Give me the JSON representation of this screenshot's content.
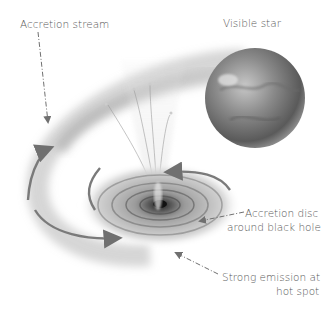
{
  "diagram": {
    "labels": {
      "accretion_stream": "Accretion stream",
      "visible_star": "Visible star",
      "disc_line1": "Accretion disc",
      "disc_line2": "around black hole",
      "hotspot_line1": "Strong emission at",
      "hotspot_line2": "hot spot"
    },
    "colors": {
      "background": "#ffffff",
      "text": "#5a5a5a",
      "arrow": "#707070",
      "star_dark": "#555555",
      "star_light": "#b8b8b8"
    }
  }
}
